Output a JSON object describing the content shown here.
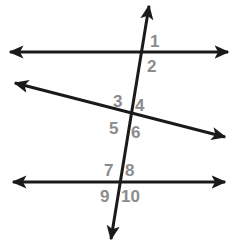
{
  "canvas": {
    "width": 237,
    "height": 245,
    "background_color": "#ffffff"
  },
  "style": {
    "line_color": "#1a1a1a",
    "line_width": 3,
    "label_color": "#8c8c8c",
    "label_font_size": 17
  },
  "figure": {
    "lines": [
      {
        "id": "top-horizontal-line",
        "name": "top-line",
        "x1": 10,
        "y1": 52,
        "x2": 228,
        "y2": 52,
        "arrow_start": true,
        "arrow_end": true
      },
      {
        "id": "middle-diagonal-line",
        "name": "middle-line",
        "x1": 15,
        "y1": 83,
        "x2": 225,
        "y2": 137,
        "arrow_start": true,
        "arrow_end": true
      },
      {
        "id": "bottom-horizontal-line",
        "name": "bottom-line",
        "x1": 13,
        "y1": 182,
        "x2": 225,
        "y2": 182,
        "arrow_start": true,
        "arrow_end": true
      },
      {
        "id": "transversal-line",
        "name": "transversal",
        "x1": 149,
        "y1": 6,
        "x2": 111,
        "y2": 239,
        "arrow_start": true,
        "arrow_end": true
      }
    ],
    "intersections": [
      {
        "id": "intersection-top",
        "x": 139,
        "y": 52
      },
      {
        "id": "intersection-middle",
        "x": 130,
        "y": 114
      },
      {
        "id": "intersection-bottom",
        "x": 120,
        "y": 183
      }
    ],
    "labels": [
      {
        "id": "angle-1",
        "text": "1",
        "x": 150,
        "y": 33,
        "intersection": "intersection-top"
      },
      {
        "id": "angle-2",
        "text": "2",
        "x": 147,
        "y": 58,
        "intersection": "intersection-top"
      },
      {
        "id": "angle-3",
        "text": "3",
        "x": 113,
        "y": 93,
        "intersection": "intersection-middle"
      },
      {
        "id": "angle-4",
        "text": "4",
        "x": 135,
        "y": 97,
        "intersection": "intersection-middle"
      },
      {
        "id": "angle-5",
        "text": "5",
        "x": 109,
        "y": 120,
        "intersection": "intersection-middle"
      },
      {
        "id": "angle-6",
        "text": "6",
        "x": 131,
        "y": 124,
        "intersection": "intersection-middle"
      },
      {
        "id": "angle-7",
        "text": "7",
        "x": 104,
        "y": 162,
        "intersection": "intersection-bottom"
      },
      {
        "id": "angle-8",
        "text": "8",
        "x": 125,
        "y": 162,
        "intersection": "intersection-bottom"
      },
      {
        "id": "angle-9",
        "text": "9",
        "x": 100,
        "y": 188,
        "intersection": "intersection-bottom"
      },
      {
        "id": "angle-10",
        "text": "10",
        "x": 121,
        "y": 188,
        "intersection": "intersection-bottom"
      }
    ]
  }
}
